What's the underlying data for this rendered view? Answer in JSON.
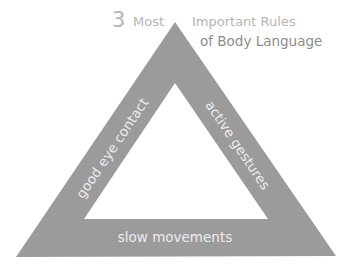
{
  "title": {
    "number": "3",
    "word_most": "Most",
    "line1_rest": "Important Rules",
    "line2": "of Body Language"
  },
  "triangle": {
    "fill_color": "#9b9b9b",
    "text_color": "#ececec",
    "outer": [
      [
        175,
        22
      ],
      [
        16,
        257
      ],
      [
        336,
        256
      ]
    ],
    "inner": [
      [
        175,
        83
      ],
      [
        84,
        219
      ],
      [
        268,
        219
      ]
    ]
  },
  "sides": {
    "left": "good eye contact",
    "right": "active gestures",
    "bottom": "slow movements"
  }
}
